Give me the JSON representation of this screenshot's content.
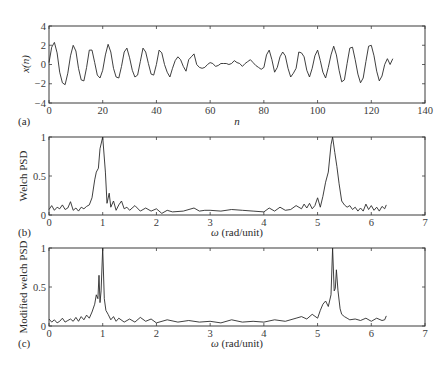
{
  "chart_data": [
    {
      "panel": "(a)",
      "type": "line",
      "title": "",
      "xlabel": "n",
      "ylabel": "x(n)",
      "xlim": [
        0,
        140
      ],
      "ylim": [
        -4,
        4
      ],
      "xticks": [
        0,
        20,
        40,
        60,
        80,
        100,
        120,
        140
      ],
      "yticks": [
        -4,
        -2,
        0,
        2,
        4
      ],
      "grid": false,
      "description": "Sinusoid-like signal, period about 6.3 samples, amplitude about 2, with a low-amplitude noisy stretch between n about 57 and 82",
      "x": [
        0,
        1,
        2,
        3,
        4,
        5,
        6,
        7,
        8,
        9,
        10,
        11,
        12,
        13,
        14,
        15,
        16,
        17,
        18,
        19,
        20,
        21,
        22,
        23,
        24,
        25,
        26,
        27,
        28,
        29,
        30,
        31,
        32,
        33,
        34,
        35,
        36,
        37,
        38,
        39,
        40,
        41,
        42,
        43,
        44,
        45,
        46,
        47,
        48,
        49,
        50,
        51,
        52,
        53,
        54,
        55,
        56,
        57,
        58,
        59,
        60,
        61,
        62,
        63,
        64,
        65,
        66,
        67,
        68,
        69,
        70,
        71,
        72,
        73,
        74,
        75,
        76,
        77,
        78,
        79,
        80,
        81,
        82,
        83,
        84,
        85,
        86,
        87,
        88,
        89,
        90,
        91,
        92,
        93,
        94,
        95,
        96,
        97,
        98,
        99,
        100,
        101,
        102,
        103,
        104,
        105,
        106,
        107,
        108,
        109,
        110,
        111,
        112,
        113,
        114,
        115,
        116,
        117,
        118,
        119,
        120,
        121,
        122,
        123,
        124,
        125,
        126,
        127,
        128
      ],
      "values": [
        0.2,
        1.8,
        2.3,
        1.2,
        -0.8,
        -1.9,
        -2.1,
        -0.9,
        0.9,
        2.0,
        1.4,
        -0.4,
        -1.6,
        -1.7,
        -0.3,
        1.5,
        1.5,
        0.2,
        -1.1,
        -1.4,
        -0.6,
        1.0,
        2.1,
        1.3,
        -0.4,
        -1.3,
        -1.4,
        -0.2,
        1.3,
        1.7,
        0.7,
        -0.6,
        -1.3,
        -1.1,
        0.3,
        1.7,
        1.3,
        0.1,
        -1.0,
        -1.1,
        0.0,
        1.5,
        1.2,
        0.0,
        -0.8,
        -1.3,
        -0.4,
        0.4,
        0.8,
        0.5,
        -0.2,
        -0.7,
        0.5,
        0.8,
        1.1,
        0.0,
        -0.3,
        -0.4,
        -0.3,
        0.0,
        0.2,
        0.1,
        -0.2,
        -0.1,
        0.1,
        0.1,
        0.1,
        0.0,
        0.1,
        0.4,
        0.2,
        0.1,
        -0.2,
        0.1,
        0.3,
        0.5,
        0.2,
        -0.1,
        -0.3,
        -0.5,
        -0.3,
        1.0,
        1.5,
        0.5,
        -0.8,
        -0.3,
        0.8,
        1.3,
        0.9,
        -0.4,
        -1.3,
        -0.9,
        -0.4,
        1.3,
        1.2,
        0.8,
        -0.6,
        -1.3,
        -0.4,
        0.9,
        1.5,
        0.4,
        -0.8,
        -1.4,
        -0.3,
        1.0,
        1.9,
        1.0,
        -0.6,
        -1.8,
        -1.6,
        0.1,
        1.7,
        1.8,
        0.5,
        -1.0,
        -1.9,
        -1.4,
        0.3,
        1.9,
        2.0,
        0.9,
        -0.7,
        -1.7,
        -1.2,
        0.0,
        0.6,
        0.0,
        0.6
      ]
    },
    {
      "panel": "(b)",
      "type": "line",
      "title": "",
      "xlabel": "ω (rad/unit)",
      "ylabel": "Welch PSD",
      "xlim": [
        0,
        7
      ],
      "ylim": [
        0,
        1
      ],
      "xticks": [
        0,
        1,
        2,
        3,
        4,
        5,
        6,
        7
      ],
      "yticks": [
        0,
        0.5,
        1
      ],
      "grid": false,
      "description": "Normalized Welch PSD over 0 to 2π with broad peaks at ω≈1.0 and ω≈5.28, noise floor about 0.05–0.15",
      "x": [
        0,
        0.05,
        0.1,
        0.15,
        0.2,
        0.25,
        0.3,
        0.35,
        0.4,
        0.45,
        0.5,
        0.55,
        0.6,
        0.65,
        0.7,
        0.75,
        0.8,
        0.85,
        0.88,
        0.92,
        0.95,
        1.0,
        1.05,
        1.08,
        1.12,
        1.15,
        1.2,
        1.25,
        1.3,
        1.35,
        1.4,
        1.45,
        1.5,
        1.6,
        1.7,
        1.8,
        1.9,
        2.0,
        2.1,
        2.2,
        2.3,
        2.5,
        2.7,
        2.8,
        2.9,
        3.0,
        3.2,
        3.4,
        3.6,
        3.8,
        4.0,
        4.1,
        4.2,
        4.3,
        4.4,
        4.5,
        4.6,
        4.7,
        4.75,
        4.8,
        4.85,
        4.9,
        4.95,
        5.0,
        5.05,
        5.1,
        5.15,
        5.2,
        5.25,
        5.28,
        5.32,
        5.36,
        5.4,
        5.45,
        5.5,
        5.55,
        5.6,
        5.65,
        5.7,
        5.75,
        5.8,
        5.85,
        5.9,
        5.95,
        6.0,
        6.05,
        6.1,
        6.15,
        6.2,
        6.25,
        6.28
      ],
      "values": [
        0.07,
        0.12,
        0.06,
        0.1,
        0.08,
        0.13,
        0.07,
        0.09,
        0.17,
        0.06,
        0.09,
        0.05,
        0.1,
        0.08,
        0.11,
        0.13,
        0.22,
        0.45,
        0.55,
        0.6,
        0.85,
        1.0,
        0.55,
        0.15,
        0.28,
        0.1,
        0.18,
        0.06,
        0.13,
        0.18,
        0.08,
        0.1,
        0.06,
        0.12,
        0.05,
        0.09,
        0.05,
        0.08,
        0.02,
        0.06,
        0.04,
        0.05,
        0.09,
        0.05,
        0.06,
        0.06,
        0.05,
        0.07,
        0.06,
        0.05,
        0.04,
        0.09,
        0.05,
        0.1,
        0.06,
        0.07,
        0.12,
        0.08,
        0.14,
        0.09,
        0.15,
        0.08,
        0.12,
        0.22,
        0.1,
        0.24,
        0.42,
        0.55,
        0.9,
        1.0,
        0.8,
        0.62,
        0.4,
        0.18,
        0.13,
        0.1,
        0.12,
        0.07,
        0.1,
        0.05,
        0.09,
        0.05,
        0.14,
        0.07,
        0.12,
        0.06,
        0.1,
        0.05,
        0.11,
        0.08,
        0.13
      ]
    },
    {
      "panel": "(c)",
      "type": "line",
      "title": "",
      "xlabel": "ω (rad/unit)",
      "ylabel": "Modified welch PSD",
      "xlim": [
        0,
        7
      ],
      "ylim": [
        0,
        1
      ],
      "xticks": [
        0,
        1,
        2,
        3,
        4,
        5,
        6,
        7
      ],
      "yticks": [
        0,
        0.5,
        1
      ],
      "grid": false,
      "description": "Normalized modified Welch PSD with sharper split peaks: ω≈0.93 (~0.65) and ω≈1.0 (1.0); ω≈5.28 (1.0) and ω≈5.35 (~0.72); noise floor about 0.03–0.12",
      "x": [
        0,
        0.05,
        0.1,
        0.15,
        0.2,
        0.25,
        0.3,
        0.35,
        0.4,
        0.45,
        0.5,
        0.55,
        0.6,
        0.65,
        0.7,
        0.75,
        0.8,
        0.85,
        0.88,
        0.91,
        0.93,
        0.95,
        0.97,
        1.0,
        1.03,
        1.06,
        1.1,
        1.15,
        1.2,
        1.25,
        1.3,
        1.4,
        1.5,
        1.6,
        1.7,
        1.8,
        1.9,
        2.0,
        2.2,
        2.4,
        2.6,
        2.8,
        3.0,
        3.2,
        3.4,
        3.6,
        3.8,
        4.0,
        4.2,
        4.4,
        4.6,
        4.7,
        4.8,
        4.9,
        5.0,
        5.05,
        5.1,
        5.15,
        5.2,
        5.25,
        5.28,
        5.31,
        5.33,
        5.35,
        5.38,
        5.42,
        5.45,
        5.5,
        5.55,
        5.6,
        5.7,
        5.8,
        5.9,
        6.0,
        6.1,
        6.2,
        6.25,
        6.28
      ],
      "values": [
        0.09,
        0.05,
        0.08,
        0.04,
        0.06,
        0.1,
        0.05,
        0.07,
        0.09,
        0.06,
        0.11,
        0.06,
        0.12,
        0.08,
        0.14,
        0.1,
        0.18,
        0.28,
        0.4,
        0.35,
        0.65,
        0.3,
        0.45,
        1.0,
        0.35,
        0.2,
        0.15,
        0.08,
        0.12,
        0.06,
        0.1,
        0.05,
        0.09,
        0.05,
        0.11,
        0.06,
        0.09,
        0.04,
        0.08,
        0.05,
        0.07,
        0.05,
        0.06,
        0.04,
        0.08,
        0.05,
        0.06,
        0.05,
        0.08,
        0.06,
        0.1,
        0.12,
        0.09,
        0.15,
        0.1,
        0.2,
        0.28,
        0.32,
        0.25,
        0.4,
        1.0,
        0.45,
        0.48,
        0.72,
        0.45,
        0.22,
        0.15,
        0.12,
        0.1,
        0.08,
        0.09,
        0.07,
        0.1,
        0.06,
        0.1,
        0.07,
        0.08,
        0.13
      ]
    }
  ],
  "panels": {
    "a": {
      "tag": "(a)",
      "xlabel": "n",
      "ylabel": "x(n)",
      "xticks": [
        "0",
        "20",
        "40",
        "60",
        "80",
        "100",
        "120",
        "140"
      ],
      "yticks": [
        "4",
        "2",
        "0",
        "−2",
        "−4"
      ]
    },
    "b": {
      "tag": "(b)",
      "xlabel": "ω (rad/unit)",
      "ylabel": "Welch PSD",
      "xticks": [
        "0",
        "1",
        "2",
        "3",
        "4",
        "5",
        "6",
        "7"
      ],
      "yticks": [
        "1",
        "0.5",
        "0"
      ]
    },
    "c": {
      "tag": "(c)",
      "xlabel": "ω (rad/unit)",
      "ylabel": "Modified welch PSD",
      "xticks": [
        "0",
        "1",
        "2",
        "3",
        "4",
        "5",
        "6",
        "7"
      ],
      "yticks": [
        "1",
        "0.5",
        "0"
      ]
    }
  },
  "colors": {
    "line": "#2a2a2a",
    "axis": "#3a3a3a",
    "background": "#ffffff"
  }
}
